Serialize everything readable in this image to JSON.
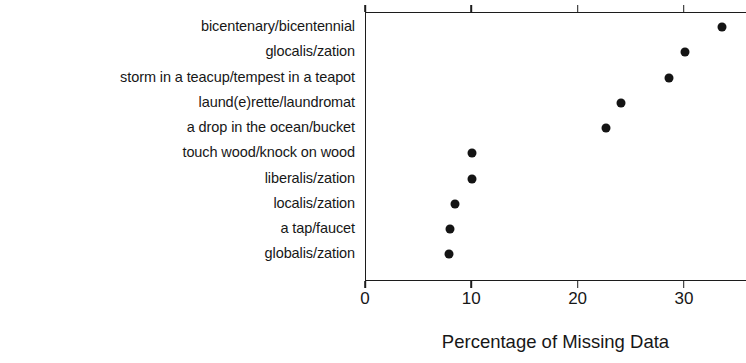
{
  "chart_data": {
    "type": "scatter",
    "title": "",
    "xlabel": "Percentage of Missing Data",
    "ylabel": "",
    "xlim": [
      0,
      35.8
    ],
    "xticks": [
      0,
      10,
      20,
      30
    ],
    "xticklabels": [
      "0",
      "10",
      "20",
      "30"
    ],
    "grid": false,
    "legend": null,
    "orientation": "horizontal-dot-plot",
    "marker": "filled-circle",
    "marker_color": "#141414",
    "categories": [
      "bicentenary/bicentennial",
      "glocalis/zation",
      "storm in a teacup/tempest in a teapot",
      "laund(e)rette/laundromat",
      "a drop in the ocean/bucket",
      "touch wood/knock on wood",
      "liberalis/zation",
      "localis/zation",
      "a tap/faucet",
      "globalis/zation"
    ],
    "values": [
      33.5,
      30.0,
      28.5,
      24.0,
      22.6,
      10.0,
      10.0,
      8.4,
      7.9,
      7.8
    ]
  },
  "axis": {
    "x_title": "Percentage of Missing Data"
  }
}
